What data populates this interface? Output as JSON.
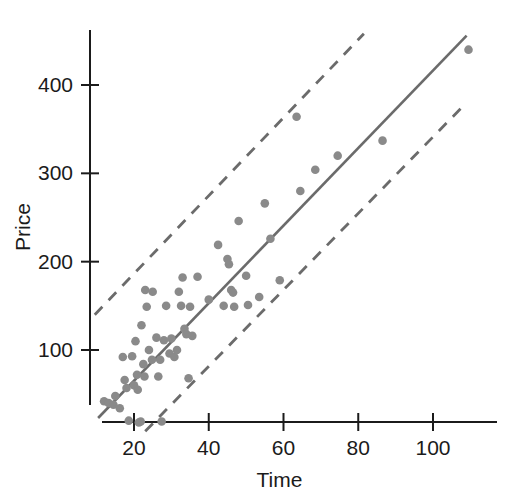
{
  "chart_data": {
    "type": "scatter",
    "title": "",
    "xlabel": "Time",
    "ylabel": "Price",
    "xlim": [
      8,
      114
    ],
    "ylim": [
      10,
      470
    ],
    "grid": false,
    "legend": "none",
    "xticks": [
      20,
      40,
      60,
      80,
      100
    ],
    "xtick_labels": [
      "20",
      "40",
      "60",
      "80",
      "100"
    ],
    "yticks": [
      100,
      200,
      300,
      400
    ],
    "ytick_labels": [
      "100",
      "200",
      "300",
      "400"
    ],
    "marker_color": "#8a8a8a",
    "line_color": "#6b6b6b",
    "axis_color": "#1b1b1b",
    "points": [
      {
        "x": 12.0,
        "y": 42
      },
      {
        "x": 13.2,
        "y": 40
      },
      {
        "x": 14.5,
        "y": 38
      },
      {
        "x": 15.0,
        "y": 48
      },
      {
        "x": 16.2,
        "y": 34
      },
      {
        "x": 17.0,
        "y": 92
      },
      {
        "x": 17.5,
        "y": 66
      },
      {
        "x": 18.0,
        "y": 57
      },
      {
        "x": 18.6,
        "y": 20
      },
      {
        "x": 19.5,
        "y": 93
      },
      {
        "x": 20.0,
        "y": 60
      },
      {
        "x": 20.4,
        "y": 110
      },
      {
        "x": 20.8,
        "y": 72
      },
      {
        "x": 21.0,
        "y": 55
      },
      {
        "x": 21.3,
        "y": 18
      },
      {
        "x": 21.8,
        "y": 19
      },
      {
        "x": 22.0,
        "y": 128
      },
      {
        "x": 22.5,
        "y": 84
      },
      {
        "x": 22.8,
        "y": 70
      },
      {
        "x": 23.0,
        "y": 168
      },
      {
        "x": 23.4,
        "y": 149
      },
      {
        "x": 24.0,
        "y": 100
      },
      {
        "x": 24.8,
        "y": 89
      },
      {
        "x": 25.0,
        "y": 166
      },
      {
        "x": 26.0,
        "y": 114
      },
      {
        "x": 26.5,
        "y": 70
      },
      {
        "x": 27.0,
        "y": 89
      },
      {
        "x": 27.4,
        "y": 19
      },
      {
        "x": 28.0,
        "y": 111
      },
      {
        "x": 28.6,
        "y": 150
      },
      {
        "x": 29.5,
        "y": 96
      },
      {
        "x": 30.0,
        "y": 113
      },
      {
        "x": 30.8,
        "y": 92
      },
      {
        "x": 31.5,
        "y": 100
      },
      {
        "x": 32.0,
        "y": 166
      },
      {
        "x": 32.6,
        "y": 150
      },
      {
        "x": 33.0,
        "y": 182
      },
      {
        "x": 33.5,
        "y": 124
      },
      {
        "x": 34.0,
        "y": 118
      },
      {
        "x": 34.6,
        "y": 68
      },
      {
        "x": 35.0,
        "y": 149
      },
      {
        "x": 35.6,
        "y": 116
      },
      {
        "x": 37.0,
        "y": 183
      },
      {
        "x": 40.0,
        "y": 157
      },
      {
        "x": 42.5,
        "y": 219
      },
      {
        "x": 44.0,
        "y": 150
      },
      {
        "x": 45.0,
        "y": 203
      },
      {
        "x": 45.4,
        "y": 197
      },
      {
        "x": 46.0,
        "y": 168
      },
      {
        "x": 46.5,
        "y": 165
      },
      {
        "x": 46.8,
        "y": 149
      },
      {
        "x": 48.0,
        "y": 246
      },
      {
        "x": 50.0,
        "y": 184
      },
      {
        "x": 50.5,
        "y": 151
      },
      {
        "x": 53.5,
        "y": 160
      },
      {
        "x": 55.0,
        "y": 266
      },
      {
        "x": 56.5,
        "y": 226
      },
      {
        "x": 59.0,
        "y": 179
      },
      {
        "x": 63.5,
        "y": 364
      },
      {
        "x": 64.5,
        "y": 280
      },
      {
        "x": 68.5,
        "y": 304
      },
      {
        "x": 74.5,
        "y": 320
      },
      {
        "x": 86.5,
        "y": 337
      },
      {
        "x": 109.5,
        "y": 440
      }
    ],
    "fit_line": {
      "style": "solid",
      "x0": 10.4,
      "y0": 23,
      "x1": 109.0,
      "y1": 456
    },
    "upper_band": {
      "style": "dashed",
      "x0": 9.5,
      "y0": 140,
      "x1": 81.5,
      "y1": 458
    },
    "lower_band": {
      "style": "dashed",
      "x0": 23.0,
      "y0": 8,
      "x1": 108.5,
      "y1": 378
    }
  }
}
